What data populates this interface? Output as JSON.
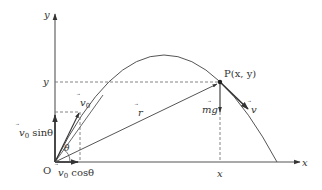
{
  "diagram": {
    "labels": {
      "y_axis": "y",
      "x_axis": "x",
      "y_level": "y",
      "x_level": "x",
      "origin": "O",
      "point": "P(x, y)",
      "v0": "v",
      "v0_sub": "0",
      "v0_sin_prefix": "v",
      "v0_sin_sub": "0",
      "v0_sin_suffix": " sinθ",
      "v0_cos_prefix": "v",
      "v0_cos_sub": "0",
      "v0_cos_suffix": " cosθ",
      "theta": "θ",
      "r": "r",
      "mg": "mg",
      "v": "v"
    },
    "colors": {
      "line": "#555555",
      "dash": "#777777",
      "text": "#333333"
    }
  }
}
